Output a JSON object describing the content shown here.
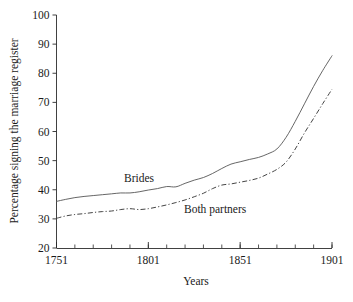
{
  "chart_data": {
    "type": "line",
    "title": "",
    "xlabel": "Years",
    "ylabel": "Percentage signing the marriage register",
    "xlim": [
      1751,
      1901
    ],
    "ylim": [
      20,
      100
    ],
    "grid": false,
    "legend_position": "inline-annotations",
    "x_major_ticks": [
      1751,
      1801,
      1851,
      1901
    ],
    "x_major_tick_labels": [
      "1751",
      "1801",
      "1851",
      "1901"
    ],
    "x_minor_tick_step": 10,
    "y_major_ticks": [
      20,
      30,
      40,
      50,
      60,
      70,
      80,
      90,
      100
    ],
    "y_major_tick_labels": [
      "20",
      "30",
      "40",
      "50",
      "60",
      "70",
      "80",
      "90",
      "100"
    ],
    "x": [
      1751,
      1756,
      1761,
      1766,
      1771,
      1776,
      1781,
      1786,
      1791,
      1796,
      1801,
      1806,
      1811,
      1816,
      1821,
      1826,
      1831,
      1836,
      1841,
      1846,
      1851,
      1856,
      1861,
      1866,
      1871,
      1876,
      1881,
      1886,
      1891,
      1896,
      1901
    ],
    "series": [
      {
        "name": "Brides",
        "style": "solid",
        "color": "#555555",
        "annotation": "Brides",
        "values": [
          36.0,
          36.7,
          37.3,
          37.7,
          38.0,
          38.3,
          38.6,
          38.9,
          38.9,
          39.3,
          39.9,
          40.4,
          41.1,
          41.0,
          42.2,
          43.3,
          44.2,
          45.6,
          47.3,
          48.8,
          49.6,
          50.4,
          51.1,
          52.3,
          54.0,
          58.0,
          63.5,
          69.5,
          75.5,
          81.0,
          86.0
        ]
      },
      {
        "name": "Both partners",
        "style": "dash-dot",
        "color": "#3a3a3a",
        "annotation": "Both partners",
        "values": [
          30.2,
          31.0,
          31.5,
          31.8,
          32.2,
          32.5,
          32.7,
          33.2,
          33.5,
          33.2,
          33.5,
          34.1,
          34.8,
          35.6,
          36.5,
          37.6,
          38.8,
          40.4,
          41.6,
          42.0,
          42.6,
          43.2,
          44.0,
          45.4,
          47.0,
          49.5,
          54.0,
          59.5,
          64.5,
          69.6,
          74.5
        ]
      }
    ],
    "series_endpoints_note": {
      "brides_final": 96,
      "both_partners_final": 94
    }
  },
  "annotations": {
    "brides_label": "Brides",
    "both_partners_label": "Both partners"
  }
}
